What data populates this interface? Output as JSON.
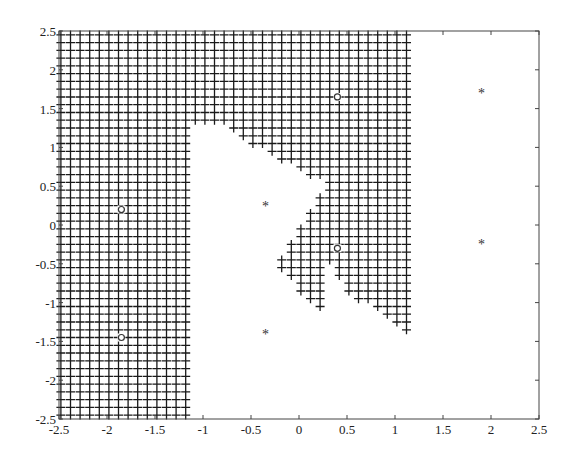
{
  "chart_data": {
    "type": "scatter",
    "title": "",
    "xlabel": "",
    "ylabel": "",
    "xlim": [
      -2.5,
      2.5
    ],
    "ylim": [
      -2.5,
      2.5
    ],
    "grid": false,
    "x_ticks": [
      "-2.5",
      "-2",
      "-1.5",
      "-1",
      "-0.5",
      "0",
      "0.5",
      "1",
      "1.5",
      "2",
      "2.5"
    ],
    "y_ticks": [
      "2.5",
      "2",
      "1.5",
      "1",
      "0.5",
      "0",
      "-0.5",
      "-1",
      "-1.5",
      "-2",
      "-2.5"
    ],
    "region_marker": "+",
    "region_grid_step": 0.1,
    "region_description": "Points marked '+' fill the decision region: x <= -1.15 for all y; for -1.15 < x <= 1.15 above a notched boundary (y >= ~1.3 near x=-1, dipping to ~0.5 at x=0.3), plus a lobe around (0.4,-0.3) extending down to y=-1.4 near x=1.0",
    "series": [
      {
        "name": "class o",
        "marker": "o",
        "points": [
          [
            -1.85,
            0.2
          ],
          [
            -1.85,
            -1.45
          ],
          [
            0.4,
            1.65
          ],
          [
            0.4,
            -0.3
          ]
        ]
      },
      {
        "name": "class *",
        "marker": "*",
        "points": [
          [
            -0.35,
            0.25
          ],
          [
            -0.35,
            -1.4
          ],
          [
            1.9,
            1.7
          ],
          [
            1.9,
            -0.25
          ]
        ]
      }
    ]
  }
}
